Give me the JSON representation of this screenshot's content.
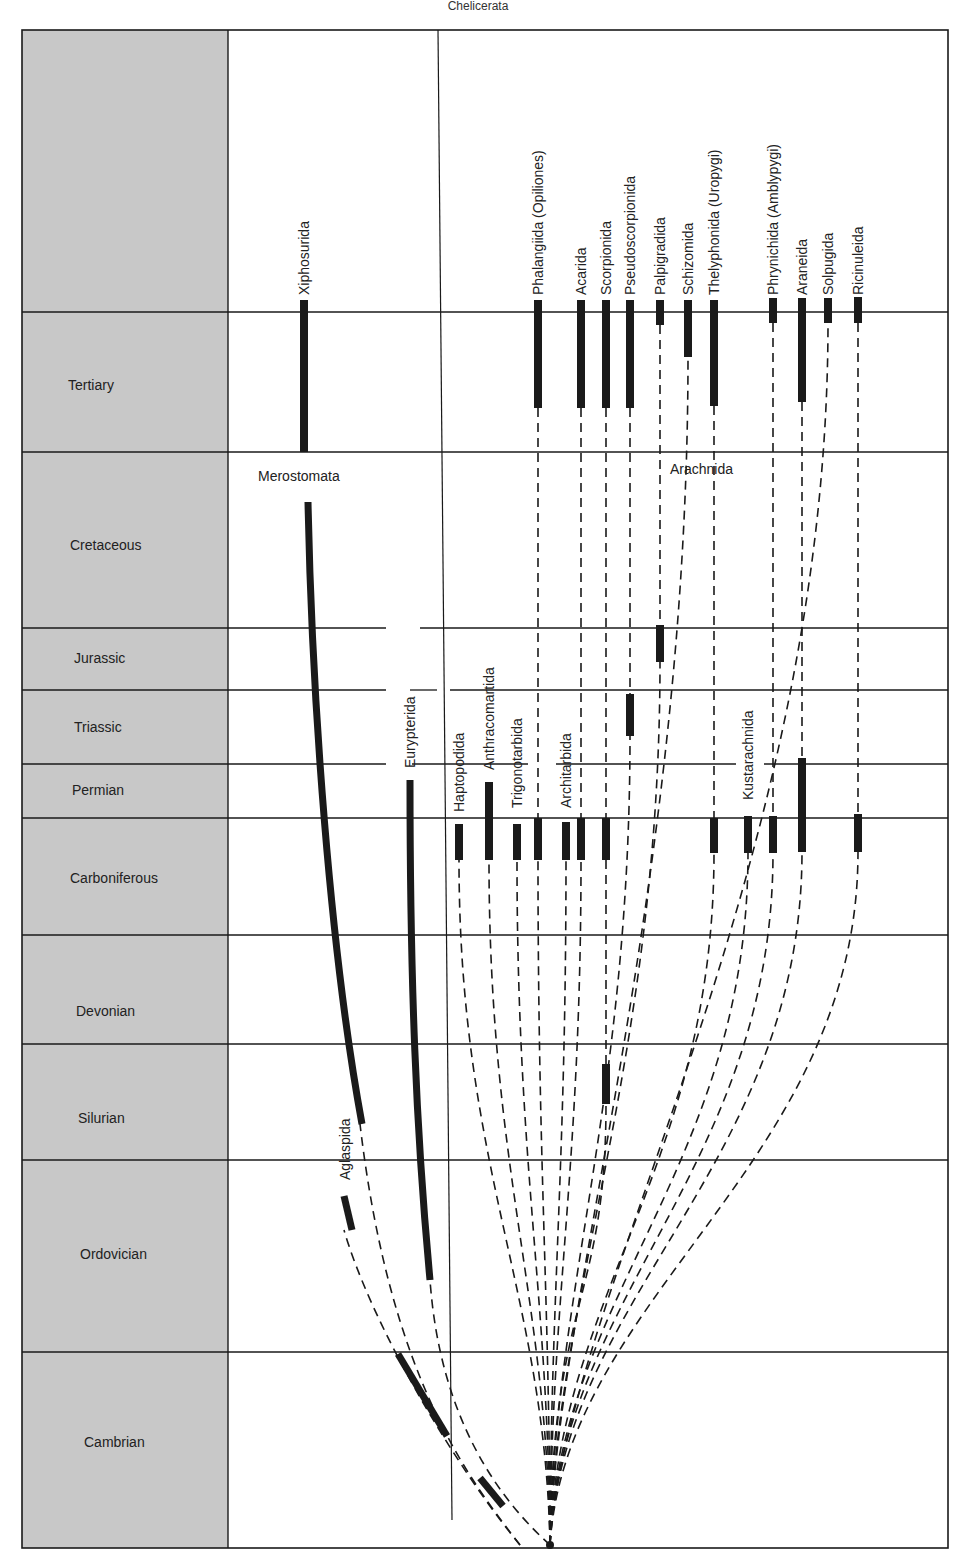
{
  "title": "Chelicerata",
  "colors": {
    "period_fill": "#c8c8c8",
    "line": "#1a1a1a",
    "bar": "#1a1a1a",
    "background": "#ffffff"
  },
  "frame": {
    "left": 22,
    "right": 948,
    "top": 30,
    "bottom": 1548,
    "period_col_right": 228,
    "mero_col_right": 452
  },
  "periods": [
    {
      "name": "Tertiary",
      "top": 312,
      "bottom": 452,
      "label_y": 390
    },
    {
      "name": "Cretaceous",
      "top": 452,
      "bottom": 628,
      "label_y": 550
    },
    {
      "name": "Jurassic",
      "top": 628,
      "bottom": 690,
      "label_y": 663
    },
    {
      "name": "Triassic",
      "top": 690,
      "bottom": 764,
      "label_y": 732
    },
    {
      "name": "Permian",
      "top": 764,
      "bottom": 818,
      "label_y": 795
    },
    {
      "name": "Carboniferous",
      "top": 818,
      "bottom": 935,
      "label_y": 883
    },
    {
      "name": "Devonian",
      "top": 935,
      "bottom": 1044,
      "label_y": 1016
    },
    {
      "name": "Silurian",
      "top": 1044,
      "bottom": 1110,
      "label_y": 1123
    },
    {
      "name": "Ordovician",
      "top": 1110,
      "bottom": 1262,
      "label_y": 1259
    },
    {
      "name": "Cambrian",
      "top": 1262,
      "bottom": 1548,
      "label_y": 1447
    }
  ],
  "boundaries_y": [
    312,
    452,
    628,
    690,
    764,
    818,
    935,
    1044,
    1160,
    1352
  ],
  "group_labels": [
    {
      "text": "Merostomata",
      "x": 258,
      "y": 481
    },
    {
      "text": "Arachnida",
      "x": 670,
      "y": 474
    }
  ],
  "taxa": [
    {
      "name": "Xiphosurida",
      "x": 304,
      "label_y": 295,
      "bars": [
        [
          300,
          452
        ]
      ]
    },
    {
      "name": "Phalangiida (Opiliones)",
      "x": 538,
      "label_y": 295,
      "bars": [
        [
          300,
          408
        ],
        [
          818,
          860
        ]
      ]
    },
    {
      "name": "Acarida",
      "x": 581,
      "label_y": 295,
      "bars": [
        [
          300,
          408
        ],
        [
          818,
          860
        ]
      ]
    },
    {
      "name": "Scorpionida",
      "x": 606,
      "label_y": 295,
      "bars": [
        [
          300,
          408
        ],
        [
          818,
          860
        ],
        [
          1064,
          1104
        ]
      ]
    },
    {
      "name": "Pseudoscorpionida",
      "x": 630,
      "label_y": 295,
      "bars": [
        [
          300,
          408
        ],
        [
          694,
          736
        ]
      ]
    },
    {
      "name": "Palpigradida",
      "x": 660,
      "label_y": 295,
      "bars": [
        [
          300,
          325
        ],
        [
          625,
          662
        ]
      ]
    },
    {
      "name": "Schizomida",
      "x": 688,
      "label_y": 295,
      "bars": [
        [
          300,
          357
        ]
      ]
    },
    {
      "name": "Thelyphonida (Uropygi)",
      "x": 714,
      "label_y": 295,
      "bars": [
        [
          300,
          406
        ],
        [
          818,
          853
        ]
      ]
    },
    {
      "name": "Phrynichida (Amblypygi)",
      "x": 773,
      "label_y": 295,
      "bars": [
        [
          298,
          323
        ],
        [
          816,
          853
        ]
      ]
    },
    {
      "name": "Araneida",
      "x": 802,
      "label_y": 295,
      "bars": [
        [
          298,
          402
        ],
        [
          758,
          852
        ]
      ]
    },
    {
      "name": "Solpugida",
      "x": 828,
      "label_y": 295,
      "bars": [
        [
          298,
          323
        ]
      ]
    },
    {
      "name": "Ricinuleida",
      "x": 858,
      "label_y": 295,
      "bars": [
        [
          297,
          323
        ],
        [
          814,
          852
        ]
      ]
    }
  ],
  "fossil_only_taxa": [
    {
      "name": "Eurypterida",
      "x": 410,
      "label_y": 768,
      "bars": [
        [
          780,
          1280
        ]
      ]
    },
    {
      "name": "Haptopodida",
      "x": 459,
      "label_y": 812,
      "bars": [
        [
          824,
          860
        ]
      ]
    },
    {
      "name": "Anthracomartida",
      "x": 489,
      "label_y": 770,
      "bars": [
        [
          782,
          860
        ]
      ]
    },
    {
      "name": "Trigonotarbida",
      "x": 517,
      "label_y": 808,
      "bars": [
        [
          824,
          860
        ]
      ]
    },
    {
      "name": "Architarbida",
      "x": 566,
      "label_y": 808,
      "bars": [
        [
          822,
          860
        ]
      ]
    },
    {
      "name": "Kustarachnida",
      "x": 748,
      "label_y": 800,
      "bars": [
        [
          816,
          853
        ]
      ]
    },
    {
      "name": "Aglaspida",
      "x": 348,
      "label_y": 1180,
      "bars": [
        [
          1196,
          1230
        ]
      ]
    }
  ],
  "chart_data": {
    "type": "range-phylogeny",
    "title": "Chelicerata",
    "time_axis": [
      "Cambrian",
      "Ordovician",
      "Silurian",
      "Devonian",
      "Carboniferous",
      "Permian",
      "Triassic",
      "Jurassic",
      "Cretaceous",
      "Tertiary"
    ],
    "groups": [
      "Merostomata",
      "Arachnida"
    ],
    "ranges": [
      {
        "taxon": "Xiphosurida",
        "group": "Merostomata",
        "solid": [
          "Tertiary"
        ]
      },
      {
        "taxon": "Merostomata (stem)",
        "group": "Merostomata",
        "solid": [
          "Silurian",
          "Devonian",
          "Carboniferous",
          "Permian",
          "Triassic",
          "Jurassic",
          "Cretaceous"
        ]
      },
      {
        "taxon": "Eurypterida",
        "group": "Merostomata",
        "solid": [
          "Ordovician",
          "Silurian",
          "Devonian",
          "Carboniferous",
          "Permian"
        ]
      },
      {
        "taxon": "Aglaspida",
        "group": "Merostomata",
        "solid": [
          "Cambrian",
          "Ordovician"
        ]
      },
      {
        "taxon": "Haptopodida",
        "group": "Arachnida",
        "solid": [
          "Carboniferous"
        ]
      },
      {
        "taxon": "Anthracomartida",
        "group": "Arachnida",
        "solid": [
          "Carboniferous",
          "Permian"
        ]
      },
      {
        "taxon": "Trigonotarbida",
        "group": "Arachnida",
        "solid": [
          "Carboniferous"
        ]
      },
      {
        "taxon": "Phalangiida (Opiliones)",
        "group": "Arachnida",
        "solid": [
          "Carboniferous",
          "Tertiary"
        ]
      },
      {
        "taxon": "Architarbida",
        "group": "Arachnida",
        "solid": [
          "Carboniferous"
        ]
      },
      {
        "taxon": "Acarida",
        "group": "Arachnida",
        "solid": [
          "Devonian",
          "Tertiary"
        ]
      },
      {
        "taxon": "Scorpionida",
        "group": "Arachnida",
        "solid": [
          "Silurian",
          "Carboniferous",
          "Triassic",
          "Tertiary"
        ]
      },
      {
        "taxon": "Pseudoscorpionida",
        "group": "Arachnida",
        "solid": [
          "Jurassic",
          "Tertiary"
        ]
      },
      {
        "taxon": "Palpigradida",
        "group": "Arachnida",
        "solid": [
          "Jurassic",
          "Tertiary"
        ]
      },
      {
        "taxon": "Schizomida",
        "group": "Arachnida",
        "solid": [
          "Tertiary"
        ]
      },
      {
        "taxon": "Thelyphonida (Uropygi)",
        "group": "Arachnida",
        "solid": [
          "Carboniferous",
          "Tertiary"
        ]
      },
      {
        "taxon": "Kustarachnida",
        "group": "Arachnida",
        "solid": [
          "Carboniferous"
        ]
      },
      {
        "taxon": "Phrynichida (Amblypygi)",
        "group": "Arachnida",
        "solid": [
          "Carboniferous",
          "Tertiary"
        ]
      },
      {
        "taxon": "Araneida",
        "group": "Arachnida",
        "solid": [
          "Carboniferous",
          "Permian",
          "Tertiary"
        ]
      },
      {
        "taxon": "Solpugida",
        "group": "Arachnida",
        "solid": [
          "Tertiary"
        ]
      },
      {
        "taxon": "Ricinuleida",
        "group": "Arachnida",
        "solid": [
          "Carboniferous",
          "Tertiary"
        ]
      }
    ],
    "origin": {
      "period": "Cambrian",
      "note": "all lineages converge at a common point at the base of the Cambrian"
    }
  }
}
